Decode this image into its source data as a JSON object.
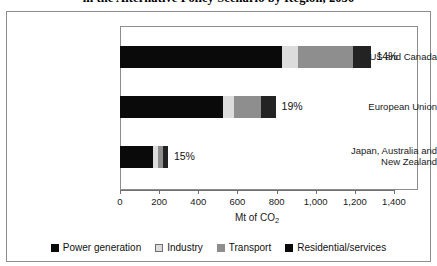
{
  "chart_data": {
    "type": "bar",
    "orientation": "horizontal",
    "stacked": true,
    "title": "in the Alternative Policy Scenario by Region, 2030",
    "xlabel": "Mt of CO2",
    "xlabel_text": "Mt of CO",
    "xlabel_sub": "2",
    "ylabel": "",
    "xlim": [
      0,
      1400
    ],
    "grid": false,
    "legend_position": "bottom",
    "categories": [
      "US and Canada",
      "European Union",
      "Japan, Australia and\nNew Zealand"
    ],
    "xticks": [
      0,
      200,
      400,
      600,
      800,
      1000,
      1200,
      1400
    ],
    "xtick_labels": [
      "0",
      "200",
      "400",
      "600",
      "800",
      "1,000",
      "1,200",
      "1,400"
    ],
    "series": [
      {
        "name": "Power generation",
        "color": "#0a0a0a",
        "values": [
          830,
          525,
          170
        ]
      },
      {
        "name": "Industry",
        "color": "#dcdcdc",
        "values": [
          80,
          55,
          25
        ]
      },
      {
        "name": "Transport",
        "color": "#8e8e8e",
        "values": [
          280,
          140,
          25
        ]
      },
      {
        "name": "Residential/services",
        "color": "#232323",
        "values": [
          90,
          75,
          25
        ]
      }
    ],
    "totals": [
      1280,
      795,
      245
    ],
    "annotations": [
      "14%",
      "19%",
      "15%"
    ]
  },
  "legend": {
    "items": [
      {
        "label": "Power generation",
        "color": "#0a0a0a"
      },
      {
        "label": "Industry",
        "color": "#dcdcdc"
      },
      {
        "label": "Transport",
        "color": "#8e8e8e"
      },
      {
        "label": "Residential/services",
        "color": "#0a0a0a"
      }
    ]
  },
  "colors": {
    "frame": "#8d8d8d",
    "axis": "#6f6f6f",
    "background": "#ffffff",
    "text": "#111111"
  }
}
